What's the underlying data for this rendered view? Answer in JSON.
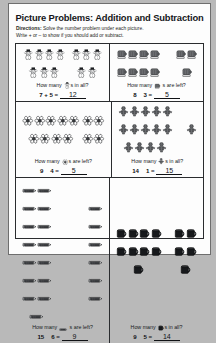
{
  "title": "Picture Problems: Addition and Subtraction",
  "directions": {
    "label": "Directions:",
    "line1": " Solve the number problem under each picture.",
    "line2": "Write + or – to show if you should add or subtract."
  },
  "problems": [
    {
      "icon": "snowman-icon",
      "question_prefix": "How many ",
      "question_suffix": "s in all?",
      "group1_count": 7,
      "group2_count": 5,
      "left": "7",
      "op": "+",
      "right": "5",
      "answer": "12"
    },
    {
      "icon": "mitten-icon",
      "question_prefix": "How many ",
      "question_suffix": " s are left?",
      "group1_count": 8,
      "group2_count": 3,
      "left": "8",
      "op": "",
      "right": "3",
      "answer": "5"
    },
    {
      "icon": "flower-icon",
      "question_prefix": "How many ",
      "question_suffix": "s are left?",
      "group1_count": 9,
      "group2_count": 4,
      "left": "9",
      "op": "",
      "right": "4",
      "answer": "5"
    },
    {
      "icon": "gingerbread-icon",
      "question_prefix": "How many ",
      "question_suffix": "s in all?",
      "group1_count": 14,
      "group2_count": 1,
      "left": "14",
      "op": "",
      "right": "1",
      "answer": "15"
    },
    {
      "icon": "pencil-icon",
      "question_prefix": "How many ",
      "question_suffix": " s are left?",
      "group1_count": 15,
      "group2_count": 6,
      "left": "15",
      "op": "",
      "right": "6",
      "answer": "9"
    },
    {
      "icon": "mug-icon",
      "question_prefix": "How many ",
      "question_suffix": "s in all?",
      "group1_count": 9,
      "group2_count": 5,
      "left": "9",
      "op": "",
      "right": "5",
      "answer": "14"
    }
  ],
  "symbols": {
    "equals": "="
  },
  "colors": {
    "ink": "#17191c",
    "page": "#fdfdfd",
    "backdrop": "#b9b9b9",
    "rule": "#2a2c2f"
  }
}
